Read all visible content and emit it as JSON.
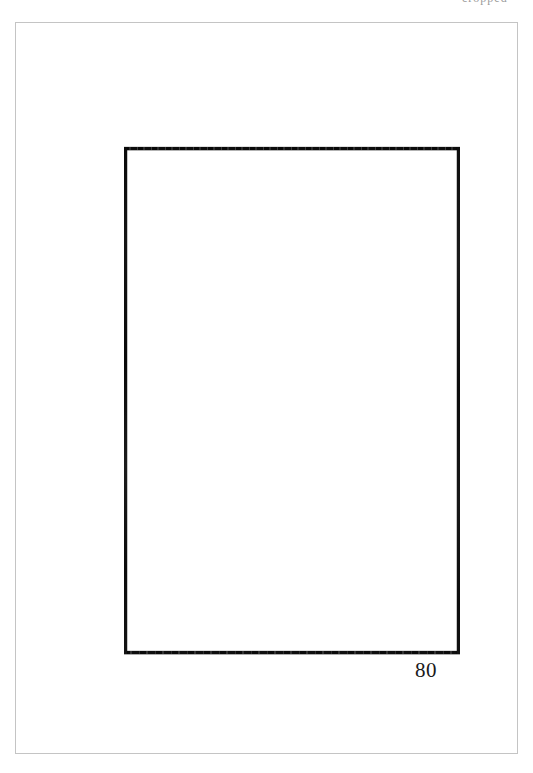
{
  "page": {
    "background_color": "#ffffff",
    "width": 533,
    "height": 773
  },
  "header": {
    "fragment_text": "cropped"
  },
  "scan_frame": {
    "border_color": "#c4c4c4"
  },
  "figure": {
    "type": "hand-drawn-rectangle",
    "stroke_color": "#111111",
    "fill_color": "#ffffff",
    "label": "80",
    "label_color": "#1a1a1a"
  }
}
